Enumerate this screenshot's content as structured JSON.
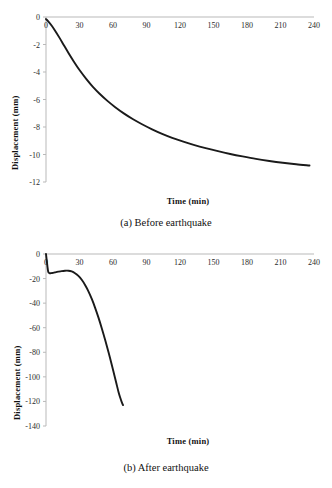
{
  "figure": {
    "panels": [
      {
        "id": "a",
        "caption": "(a) Before earthquake",
        "chart_index": 0
      },
      {
        "id": "b",
        "caption": "(b) After earthquake",
        "chart_index": 1
      }
    ]
  },
  "chart_data": [
    {
      "type": "line",
      "title": "",
      "xlabel": "Time (min)",
      "ylabel": "Displacement (mm)",
      "xlim": [
        0,
        240
      ],
      "ylim": [
        -12,
        0
      ],
      "xticks": [
        0,
        30,
        60,
        90,
        120,
        150,
        180,
        210,
        240
      ],
      "xticklabels": [
        "0",
        "30",
        "60",
        "90",
        "120",
        "150",
        "180",
        "210",
        "240"
      ],
      "yticks": [
        0,
        -2,
        -4,
        -6,
        -8,
        -10,
        -12
      ],
      "yticklabels": [
        "0",
        "-2",
        "-4",
        "-6",
        "-8",
        "-10",
        "-12"
      ],
      "grid": false,
      "legend": null,
      "line_color": "#1a1a1a",
      "line_width": 1.9,
      "x": [
        0,
        2,
        5,
        8,
        12,
        16,
        20,
        25,
        30,
        36,
        42,
        48,
        55,
        62,
        70,
        78,
        86,
        95,
        104,
        113,
        123,
        133,
        143,
        154,
        165,
        176,
        188,
        200,
        212,
        224,
        236
      ],
      "y": [
        -0.15,
        -0.32,
        -0.62,
        -0.98,
        -1.5,
        -2.05,
        -2.6,
        -3.25,
        -3.86,
        -4.5,
        -5.08,
        -5.58,
        -6.1,
        -6.56,
        -7.03,
        -7.44,
        -7.8,
        -8.17,
        -8.5,
        -8.79,
        -9.07,
        -9.32,
        -9.54,
        -9.76,
        -9.96,
        -10.14,
        -10.32,
        -10.47,
        -10.6,
        -10.71,
        -10.8
      ]
    },
    {
      "type": "line",
      "title": "",
      "xlabel": "Time (min)",
      "ylabel": "Displacement (mm)",
      "xlim": [
        0,
        240
      ],
      "ylim": [
        -140,
        0
      ],
      "xticks": [
        0,
        30,
        60,
        90,
        120,
        150,
        180,
        210,
        240
      ],
      "xticklabels": [
        "0",
        "30",
        "60",
        "90",
        "120",
        "150",
        "180",
        "210",
        "240"
      ],
      "yticks": [
        0,
        -20,
        -40,
        -60,
        -80,
        -100,
        -120,
        -140
      ],
      "yticklabels": [
        "0",
        "-20",
        "-40",
        "-60",
        "-80",
        "-100",
        "-120",
        "-140"
      ],
      "grid": false,
      "legend": null,
      "line_color": "#1a1a1a",
      "line_width": 1.9,
      "x": [
        0,
        0.5,
        1.2,
        2,
        3,
        4.5,
        6,
        8,
        11,
        14,
        17,
        20,
        23,
        26,
        29,
        32,
        35,
        38,
        41,
        44,
        47,
        50,
        53,
        56,
        59,
        61,
        63,
        65,
        66.5,
        68,
        69
      ],
      "y": [
        0,
        -4,
        -9.5,
        -14.5,
        -15.5,
        -15.6,
        -15.4,
        -15.0,
        -14.4,
        -13.9,
        -13.6,
        -13.6,
        -14.2,
        -15.6,
        -17.8,
        -21.0,
        -25.2,
        -30.4,
        -36.6,
        -43.8,
        -51.8,
        -60.6,
        -70.0,
        -80.0,
        -90.5,
        -97.8,
        -105.2,
        -112.5,
        -117.0,
        -121.0,
        -123.0
      ]
    }
  ]
}
